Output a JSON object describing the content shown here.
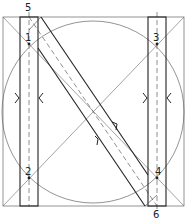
{
  "diagram": {
    "colors": {
      "stroke": "#222222",
      "guide": "#555555",
      "background": "#ffffff"
    },
    "points": [
      {
        "id": "1",
        "label": "1",
        "x": 29,
        "y": 44,
        "lx": 25,
        "ly": 41
      },
      {
        "id": "2",
        "label": "2",
        "x": 29,
        "y": 178,
        "lx": 25,
        "ly": 175
      },
      {
        "id": "3",
        "label": "3",
        "x": 157,
        "y": 44,
        "lx": 153,
        "ly": 41
      },
      {
        "id": "4",
        "label": "4",
        "x": 157,
        "y": 178,
        "lx": 155,
        "ly": 175
      },
      {
        "id": "5",
        "label": "5",
        "x": 29,
        "y": 17,
        "lx": 25,
        "ly": 11
      },
      {
        "id": "6",
        "label": "6",
        "x": 157,
        "y": 206,
        "lx": 153,
        "ly": 218
      }
    ]
  }
}
